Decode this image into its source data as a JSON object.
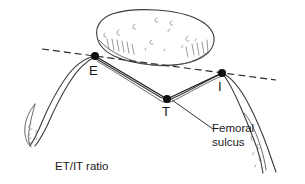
{
  "figure": {
    "title": "ET/IT ratio",
    "caption_label": "ET/IT ratio",
    "annotation_label": "Femoral sulcus",
    "annotation_line1": "Femoral",
    "annotation_line2": "sulcus",
    "view": "axial patellofemoral joint line drawing"
  },
  "points": [
    {
      "id": "E",
      "label": "E",
      "meaning": "medial trochlear edge",
      "x": 95,
      "y": 56
    },
    {
      "id": "T",
      "label": "T",
      "meaning": "trochlear sulcus trough",
      "x": 167,
      "y": 99
    },
    {
      "id": "I",
      "label": "I",
      "meaning": "lateral trochlear edge",
      "x": 222,
      "y": 73
    }
  ],
  "structures": [
    {
      "name": "patella",
      "type": "bone-outline"
    },
    {
      "name": "medial-femoral-condyle",
      "type": "bone-outline"
    },
    {
      "name": "lateral-femoral-condyle",
      "type": "bone-outline"
    },
    {
      "name": "femoral-sulcus",
      "type": "bone-outline"
    },
    {
      "name": "trabecular-texture",
      "type": "texture"
    },
    {
      "name": "cartilage-hatching",
      "type": "texture"
    }
  ],
  "lines": [
    {
      "name": "tangent-line",
      "style": "dashed",
      "from": [
        42,
        49
      ],
      "to": [
        276,
        80
      ]
    },
    {
      "name": "et-segment",
      "style": "solid",
      "from": [
        95,
        56
      ],
      "to": [
        167,
        99
      ]
    },
    {
      "name": "it-segment",
      "style": "solid",
      "from": [
        167,
        99
      ],
      "to": [
        222,
        73
      ]
    },
    {
      "name": "annotation-leader",
      "style": "solid",
      "from": [
        172,
        100
      ],
      "to": [
        213,
        129
      ]
    }
  ],
  "colors": {
    "background": "#ffffff",
    "outline": "#3a3a3a",
    "measure": "#1a1a1a",
    "dashed": "#2a2a2a",
    "texture": "#8a8a8a",
    "text": "#1a1a1a",
    "marker": "#111111"
  }
}
